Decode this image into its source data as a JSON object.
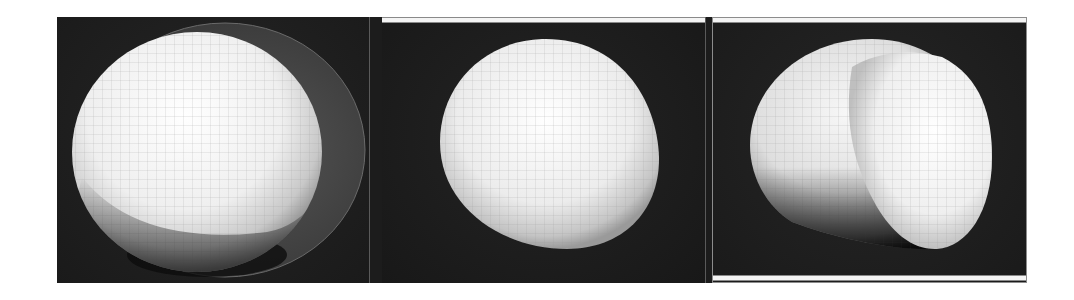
{
  "figure": {
    "panels": [
      {
        "id": "p1",
        "content": "sphere with offset translucent outer shell"
      },
      {
        "id": "p2",
        "content": "slightly deformed sphere"
      },
      {
        "id": "p3",
        "content": "sphere with cut/creased segment"
      }
    ]
  },
  "colors": {
    "background": "#1c1c1c",
    "sphere_highlight": "#ffffff",
    "sphere_shade": "#bdbdbd",
    "grid_line": "#9a9a9a",
    "shell": "#4a4a4a",
    "bar": "#f4f4f4"
  }
}
